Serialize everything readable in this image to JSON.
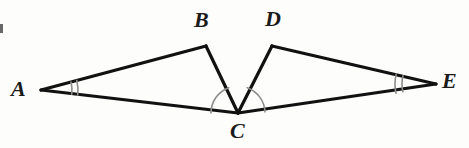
{
  "figure": {
    "background_color": "#fdfdfc",
    "stroke_color": "#111111",
    "arc_color": "#8d8d8d",
    "label_color": "#1b1b1b",
    "stroke_width": 3.2,
    "arc_width": 1.6,
    "width": 469,
    "height": 148
  },
  "points": {
    "A": {
      "label": "A",
      "x": 41,
      "y": 90,
      "label_x": 11,
      "label_y": 78
    },
    "B": {
      "label": "B",
      "x": 206,
      "y": 46,
      "label_x": 194,
      "label_y": 9
    },
    "C": {
      "label": "C",
      "x": 238,
      "y": 113,
      "label_x": 230,
      "label_y": 120
    },
    "D": {
      "label": "D",
      "x": 272,
      "y": 46,
      "label_x": 265,
      "label_y": 8
    },
    "E": {
      "label": "E",
      "x": 436,
      "y": 84,
      "label_x": 442,
      "label_y": 70
    }
  },
  "segments": [
    {
      "name": "segment-AB",
      "from": "A",
      "to": "B"
    },
    {
      "name": "segment-BC",
      "from": "B",
      "to": "C"
    },
    {
      "name": "segment-AC",
      "from": "A",
      "to": "C"
    },
    {
      "name": "segment-CD",
      "from": "C",
      "to": "D"
    },
    {
      "name": "segment-DE",
      "from": "D",
      "to": "E"
    },
    {
      "name": "segment-CE",
      "from": "C",
      "to": "E"
    }
  ],
  "angle_marks": [
    {
      "name": "angle-mark-A",
      "vertex": "A",
      "style": "double-arc",
      "arc_count": 2,
      "radius_1": 31,
      "radius_2": 37,
      "start_deg": -15.0,
      "end_deg": 8.0
    },
    {
      "name": "angle-mark-E",
      "vertex": "E",
      "style": "double-arc",
      "arc_count": 2,
      "radius_1": 34,
      "radius_2": 41,
      "start_deg": 167.0,
      "end_deg": 194.0
    },
    {
      "name": "angle-mark-C-left",
      "vertex": "C",
      "style": "single-arc",
      "arc_count": 1,
      "radius_1": 27,
      "start_deg": 180.0,
      "end_deg": 250.0
    },
    {
      "name": "angle-mark-C-right",
      "vertex": "C",
      "style": "single-arc",
      "arc_count": 1,
      "radius_1": 27,
      "start_deg": 290.0,
      "end_deg": 358.0
    }
  ],
  "artifacts": [
    {
      "name": "scan-edge-artifact",
      "x": 0,
      "y": 24,
      "width": 3,
      "height": 9
    }
  ]
}
